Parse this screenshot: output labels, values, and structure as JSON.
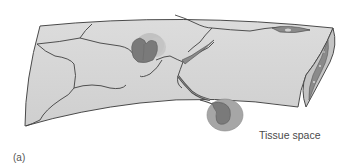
{
  "figure": {
    "panel_label": "(a)",
    "labels": {
      "tissue_space": "Tissue space"
    },
    "colors": {
      "vessel_fill": "#d4d4d4",
      "vessel_outline": "#4a4a4a",
      "lumen_dark": "#8a8a8a",
      "cell_light": "#b5b5b5",
      "cell_mid": "#9c9c9c",
      "cell_dark": "#7a7a7a",
      "endothelial_junction": "#3f3f3f"
    }
  }
}
